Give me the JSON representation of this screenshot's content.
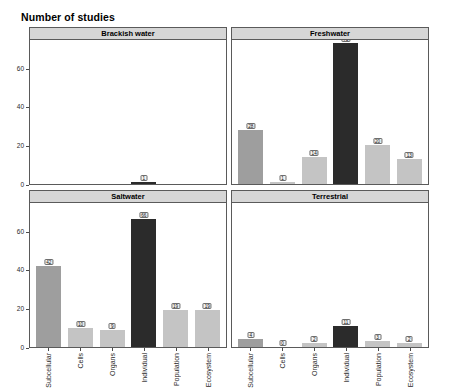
{
  "title": "Number of studies",
  "chart_data": {
    "type": "bar",
    "title": "Number of studies",
    "xlabel": "",
    "ylabel": "",
    "ylim": [
      0,
      75
    ],
    "yticks": [
      0,
      20,
      40,
      60
    ],
    "grid": false,
    "legend": "none",
    "layout": "2x2 faceted panels",
    "categories": [
      "Subcellular",
      "Cells",
      "Organs",
      "Individual",
      "Population",
      "Ecosystem"
    ],
    "panels": [
      {
        "name": "Brackish water",
        "position": "top-left",
        "values": [
          0,
          0,
          0,
          1,
          0,
          0
        ],
        "labels": [
          "",
          "",
          "",
          "1",
          "",
          ""
        ],
        "tones": [
          "mid",
          "light",
          "light",
          "dark",
          "light",
          "light"
        ]
      },
      {
        "name": "Freshwater",
        "position": "top-right",
        "values": [
          28,
          1,
          14,
          73,
          20,
          13
        ],
        "labels": [
          "28",
          "1",
          "14",
          "73",
          "20",
          "13"
        ],
        "tones": [
          "mid",
          "light",
          "light",
          "dark",
          "light",
          "light"
        ]
      },
      {
        "name": "Saltwater",
        "position": "bottom-left",
        "values": [
          42,
          10,
          9,
          66,
          19,
          19
        ],
        "labels": [
          "42",
          "10",
          "9",
          "66",
          "19",
          "19"
        ],
        "tones": [
          "mid",
          "light",
          "light",
          "dark",
          "light",
          "light"
        ]
      },
      {
        "name": "Terrestrial",
        "position": "bottom-right",
        "values": [
          4,
          0,
          2,
          11,
          3,
          2
        ],
        "labels": [
          "4",
          "0",
          "2",
          "11",
          "3",
          "2"
        ],
        "tones": [
          "mid",
          "light",
          "light",
          "dark",
          "light",
          "light"
        ]
      }
    ]
  },
  "colors": {
    "bar_mid": "#9e9e9e",
    "bar_light": "#c4c4c4",
    "bar_dark": "#2b2b2b",
    "strip_background": "#d6d6d6",
    "panel_border": "#5a5a5a",
    "plot_background": "#ffffff",
    "label_box_background": "#f2f2f2"
  }
}
